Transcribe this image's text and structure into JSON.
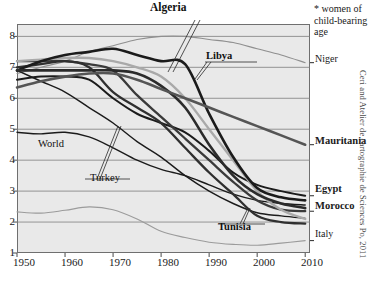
{
  "chart_data": {
    "type": "line",
    "title": "Algeria",
    "xlabel": "",
    "ylabel": "",
    "xlim": [
      1950,
      2011
    ],
    "ylim": [
      1,
      8.4
    ],
    "xticks": [
      1950,
      1960,
      1970,
      1980,
      1990,
      2000,
      2010
    ],
    "yticks": [
      1,
      2,
      3,
      4,
      5,
      6,
      7,
      8
    ],
    "grid": "horizontal",
    "legend_position": "right-edge-labels",
    "annotation": "* women of child-bearing age",
    "credit": "Ceri and Atelier de cartographie de Sciences Po, 2011",
    "x": [
      1950,
      1955,
      1960,
      1965,
      1970,
      1975,
      1980,
      1985,
      1990,
      1995,
      2000,
      2005,
      2010
    ],
    "series": [
      {
        "name": "Algeria",
        "color": "#1b1b1b",
        "width": 2.6,
        "values": [
          6.9,
          7.2,
          7.4,
          7.5,
          7.6,
          7.4,
          7.2,
          7.1,
          5.5,
          4.1,
          3.1,
          2.8,
          2.7
        ]
      },
      {
        "name": "Libya",
        "color": "#2b2b2b",
        "width": 2.6,
        "values": [
          6.9,
          6.9,
          6.9,
          6.9,
          6.9,
          6.8,
          6.4,
          5.7,
          4.5,
          3.5,
          2.9,
          2.6,
          2.45
        ]
      },
      {
        "name": "Niger",
        "color": "#8f8f8f",
        "width": 1.1,
        "values": [
          6.8,
          7.0,
          7.2,
          7.5,
          7.7,
          7.9,
          8.0,
          8.0,
          7.9,
          7.8,
          7.6,
          7.4,
          7.15
        ]
      },
      {
        "name": "Mauritania",
        "color": "#555555",
        "width": 2.6,
        "values": [
          6.35,
          6.55,
          6.7,
          6.8,
          6.8,
          6.6,
          6.3,
          6.0,
          5.7,
          5.4,
          5.1,
          4.8,
          4.5
        ]
      },
      {
        "name": "Egypt",
        "color": "#1b1b1b",
        "width": 2.0,
        "values": [
          6.6,
          6.7,
          6.7,
          6.6,
          6.0,
          5.5,
          5.2,
          4.9,
          4.3,
          3.6,
          3.2,
          3.0,
          2.85
        ]
      },
      {
        "name": "Morocco",
        "color": "#3a3a3a",
        "width": 2.3,
        "values": [
          7.2,
          7.2,
          7.2,
          7.1,
          6.9,
          6.1,
          5.4,
          4.7,
          4.0,
          3.3,
          2.7,
          2.4,
          2.35
        ]
      },
      {
        "name": "Tunisia",
        "color": "#2f2f2f",
        "width": 2.3,
        "values": [
          7.0,
          7.1,
          7.2,
          7.0,
          6.2,
          5.7,
          5.2,
          4.4,
          3.6,
          2.9,
          2.2,
          2.0,
          1.95
        ]
      },
      {
        "name": "Algeria-light",
        "color": "#a9a9a9",
        "width": 2.4,
        "values": [
          7.2,
          7.25,
          7.3,
          7.3,
          7.2,
          7.0,
          6.7,
          6.0,
          5.0,
          4.0,
          3.0,
          2.4,
          2.1
        ]
      },
      {
        "name": "World",
        "color": "#1b1b1b",
        "width": 1.4,
        "values": [
          4.9,
          4.85,
          4.9,
          4.75,
          4.4,
          4.0,
          3.7,
          3.5,
          3.2,
          2.9,
          2.7,
          2.6,
          2.55
        ]
      },
      {
        "name": "Turkey",
        "color": "#1b1b1b",
        "width": 1.4,
        "values": [
          6.9,
          6.55,
          6.2,
          5.7,
          5.2,
          4.6,
          4.1,
          3.5,
          3.0,
          2.6,
          2.3,
          2.2,
          2.12
        ]
      },
      {
        "name": "Italy",
        "color": "#9b9b9b",
        "width": 1.1,
        "values": [
          2.33,
          2.29,
          2.38,
          2.49,
          2.4,
          2.1,
          1.7,
          1.5,
          1.35,
          1.28,
          1.25,
          1.32,
          1.4
        ]
      }
    ]
  },
  "axes": {
    "yticks": [
      "8",
      "7",
      "6",
      "5",
      "4",
      "3",
      "2",
      "1"
    ],
    "xticks": [
      "1950",
      "1960",
      "1970",
      "1980",
      "1990",
      "2000",
      "2010"
    ]
  },
  "title": "Algeria",
  "note": {
    "line1": "* women of",
    "line2": "child-bearing",
    "line3": "age"
  },
  "right_labels": {
    "niger": "Niger",
    "mauritania": "Mauritania",
    "egypt": "Egypt",
    "morocco": "Morocco",
    "italy": "Italy"
  },
  "inner_labels": {
    "libya": "Libya",
    "world": "World",
    "turkey": "Turkey",
    "tunisia": "Tunisia"
  },
  "credit": "Ceri and Atelier de cartographie de Sciences Po, 2011"
}
